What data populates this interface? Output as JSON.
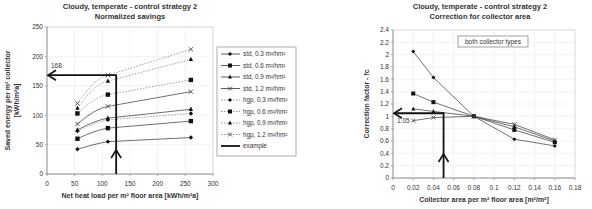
{
  "chart_data": [
    {
      "type": "line",
      "title": "Cloudy, temperate - control strategy 2",
      "subtitle": "Normalized savings",
      "xlabel": "Net heat load per m² floor area [kWh/m²a]",
      "ylabel": "Saved energy per m² collector",
      "ylabel2": "[kWh/m²a]",
      "xlim": [
        0,
        300
      ],
      "ylim": [
        0,
        250
      ],
      "xticks": [
        0,
        50,
        100,
        150,
        200,
        250,
        300
      ],
      "yticks": [
        0,
        50,
        100,
        150,
        200,
        250
      ],
      "grid": true,
      "legend_position": "right",
      "x": [
        55,
        110,
        260
      ],
      "series": [
        {
          "name": "std, 0.3 m²/hm²",
          "marker": "diamond",
          "dash": false,
          "values": [
            42,
            55,
            62
          ]
        },
        {
          "name": "std, 0.6 m²/hm²",
          "marker": "square",
          "dash": false,
          "values": [
            60,
            78,
            90
          ]
        },
        {
          "name": "std, 0.9 m²/hm²",
          "marker": "triangle",
          "dash": false,
          "values": [
            75,
            95,
            110
          ]
        },
        {
          "name": "std, 1.2 m²/hm²",
          "marker": "x",
          "dash": false,
          "values": [
            85,
            115,
            140
          ]
        },
        {
          "name": "hgp, 0.3 m²/hm²",
          "marker": "diamond",
          "dash": true,
          "values": [
            73,
            92,
            103
          ]
        },
        {
          "name": "hgp, 0.6 m²/hm²",
          "marker": "square",
          "dash": true,
          "values": [
            103,
            135,
            160
          ]
        },
        {
          "name": "hgp, 0.9 m²/hm²",
          "marker": "triangle",
          "dash": true,
          "values": [
            112,
            158,
            195
          ]
        },
        {
          "name": "hgp, 1.2 m²/hm²",
          "marker": "x",
          "dash": true,
          "values": [
            120,
            168,
            212
          ]
        }
      ],
      "example": {
        "name": "example",
        "x_start": 125,
        "y_result": 168,
        "label": "168"
      }
    },
    {
      "type": "line",
      "title": "Cloudy, temperate - control strategy 2",
      "subtitle": "Correction for collector area",
      "xlabel": "Collector area per m² floor area [m²/m²]",
      "ylabel": "Correction factor - fc",
      "xlim": [
        0,
        0.18
      ],
      "ylim": [
        0,
        2.4
      ],
      "xticks": [
        0,
        0.02,
        0.04,
        0.06,
        0.08,
        0.1,
        0.12,
        0.14,
        0.16,
        0.18
      ],
      "yticks": [
        0,
        0.2,
        0.4,
        0.6,
        0.8,
        1,
        1.2,
        1.4,
        1.6,
        1.8,
        2,
        2.2,
        2.4
      ],
      "grid": true,
      "annotation": "both collector types",
      "x": [
        0.02,
        0.04,
        0.08,
        0.12,
        0.16
      ],
      "series": [
        {
          "name": "curve 1",
          "marker": "diamond",
          "values": [
            2.05,
            1.63,
            1.0,
            0.63,
            0.52
          ]
        },
        {
          "name": "curve 2",
          "marker": "square",
          "values": [
            1.37,
            1.23,
            1.0,
            0.78,
            0.58
          ]
        },
        {
          "name": "curve 3",
          "marker": "triangle",
          "values": [
            1.12,
            1.08,
            1.0,
            0.83,
            0.6
          ]
        },
        {
          "name": "curve 4",
          "marker": "x",
          "values": [
            0.93,
            0.98,
            1.0,
            0.87,
            0.62
          ]
        }
      ],
      "example": {
        "x_start": 0.05,
        "y_result": 1.05,
        "label": "1.05"
      }
    }
  ]
}
